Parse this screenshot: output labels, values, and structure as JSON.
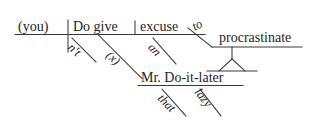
{
  "page": {
    "item_number": "29.",
    "background_color": "#ffffff",
    "line_color": "#3a3a3a",
    "text_color": "#1e1e1e"
  },
  "diagram": {
    "type": "reed-kellogg-sentence-diagram",
    "baseline_words": {
      "subject": "(you)",
      "verb": "Do give",
      "direct_object": "excuse",
      "indirect_object": "Mr. Do-it-later",
      "infinitive_verb": "procrastinate"
    },
    "modifiers": {
      "adverb_not": "n't",
      "expletive": "(x)",
      "article_an": "an",
      "preposition_to": "to",
      "determiner_that": "that",
      "adjective_lazy": "lazy"
    }
  }
}
